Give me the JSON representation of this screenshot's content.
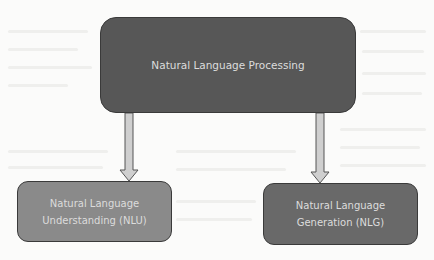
{
  "diagram": {
    "type": "hierarchy",
    "root": {
      "id": "nlp",
      "label": "Natural Language Processing",
      "fill": "#575757"
    },
    "children": [
      {
        "id": "nlu",
        "label": "Natural Language\nUnderstanding (NLU)",
        "fill": "#8a8a8a"
      },
      {
        "id": "nlg",
        "label": "Natural Language\nGeneration (NLG)",
        "fill": "#696969"
      }
    ],
    "edges": [
      {
        "from": "nlp",
        "to": "nlu",
        "style": "block-arrow"
      },
      {
        "from": "nlp",
        "to": "nlg",
        "style": "block-arrow"
      }
    ],
    "arrow_fill": "#cfcfcf",
    "arrow_stroke": "#555555"
  }
}
